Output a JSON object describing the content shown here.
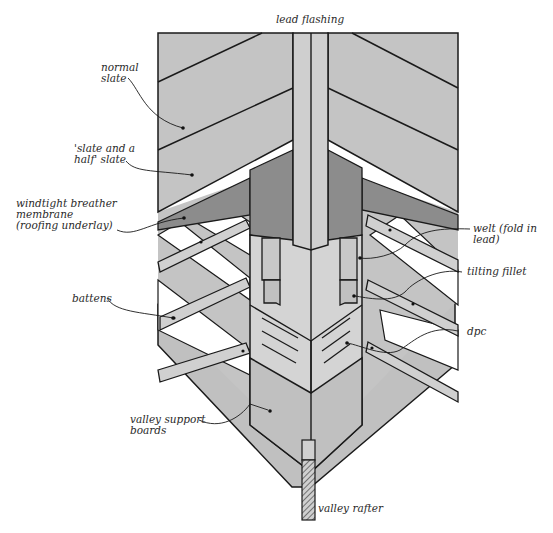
{
  "diagram": {
    "colors": {
      "slate": "#c4c4c4",
      "membrane": "#8c8c8c",
      "lead": "#d4d4d4",
      "lead_flashing": "#cfcfcf",
      "timber": "#d0d0d0",
      "board": "#bdbdbd",
      "outline": "#1a1a1a",
      "background": "#ffffff"
    },
    "labels": {
      "lead_flashing": "lead flashing",
      "normal_slate": "normal\nslate",
      "slate_and_half": "'slate and a\nhalf' slate",
      "membrane": "windtight breather\nmembrane\n(roofing underlay)",
      "battens": "battens",
      "valley_boards": "valley support\nboards",
      "welt": "welt (fold in\nlead)",
      "tilting_fillet": "tilting fillet",
      "dpc": "dpc",
      "valley_rafter": "valley rafter"
    }
  }
}
